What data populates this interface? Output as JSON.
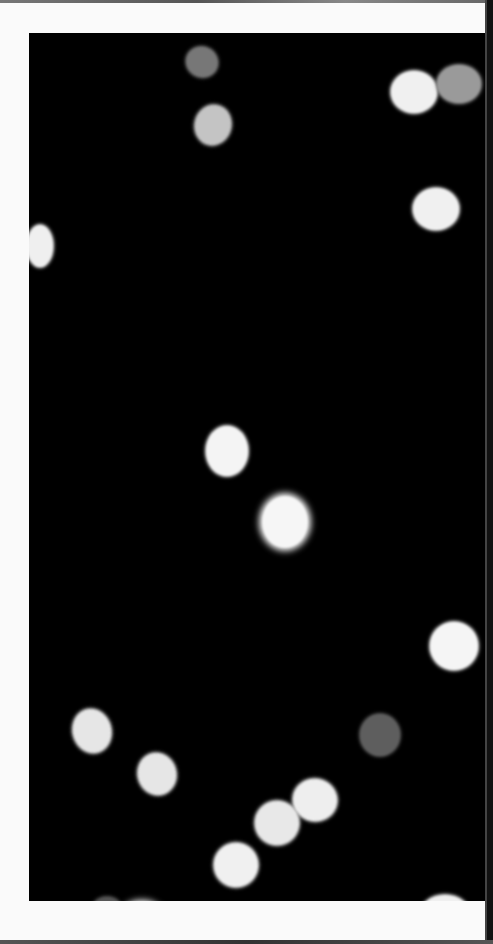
{
  "image": {
    "description": "Out-of-focus bokeh light dots on black background, framed by white border",
    "background_color": "#000000",
    "border_color": "#fafafa",
    "frame": {
      "left": 29,
      "top": 33,
      "width": 456,
      "height": 868
    },
    "dots": [
      {
        "x": 157,
        "y": 14,
        "w": 32,
        "h": 30,
        "color": "#777777",
        "rot": 25
      },
      {
        "x": 166,
        "y": 72,
        "w": 36,
        "h": 40,
        "color": "#c4c4c4",
        "rot": 15
      },
      {
        "x": 362,
        "y": 38,
        "w": 46,
        "h": 42,
        "color": "#f0f0f0",
        "rot": 0
      },
      {
        "x": 408,
        "y": 32,
        "w": 44,
        "h": 38,
        "color": "#9a9a9a",
        "rot": 0
      },
      {
        "x": 384,
        "y": 155,
        "w": 46,
        "h": 42,
        "color": "#f0f0f0",
        "rot": 0
      },
      {
        "x": -2,
        "y": 192,
        "w": 26,
        "h": 42,
        "color": "#efefef",
        "rot": 0
      },
      {
        "x": 177,
        "y": 393,
        "w": 42,
        "h": 50,
        "color": "#f4f4f4",
        "rot": 0
      },
      {
        "x": 233,
        "y": 463,
        "w": 46,
        "h": 52,
        "color": "#f6f6f6",
        "rot": 0,
        "glow": true
      },
      {
        "x": 401,
        "y": 589,
        "w": 48,
        "h": 48,
        "color": "#f5f5f5",
        "rot": 0
      },
      {
        "x": 331,
        "y": 681,
        "w": 40,
        "h": 42,
        "color": "#5e5e5e",
        "rot": 0
      },
      {
        "x": 44,
        "y": 676,
        "w": 38,
        "h": 44,
        "color": "#e6e6e6",
        "rot": -15
      },
      {
        "x": 109,
        "y": 720,
        "w": 38,
        "h": 42,
        "color": "#e6e6e6",
        "rot": -15
      },
      {
        "x": 264,
        "y": 746,
        "w": 44,
        "h": 42,
        "color": "#eeeeee",
        "rot": 10
      },
      {
        "x": 226,
        "y": 768,
        "w": 44,
        "h": 44,
        "color": "#e8e8e8",
        "rot": 10
      },
      {
        "x": 185,
        "y": 810,
        "w": 44,
        "h": 44,
        "color": "#f0f0f0",
        "rot": 10
      },
      {
        "x": 63,
        "y": 864,
        "w": 30,
        "h": 26,
        "color": "#555555",
        "rot": 0
      },
      {
        "x": 93,
        "y": 870,
        "w": 40,
        "h": 30,
        "color": "#f5f5f5",
        "rot": 0,
        "glow": true
      },
      {
        "x": 391,
        "y": 862,
        "w": 50,
        "h": 40,
        "color": "#f0f0f0",
        "rot": 0
      }
    ]
  }
}
